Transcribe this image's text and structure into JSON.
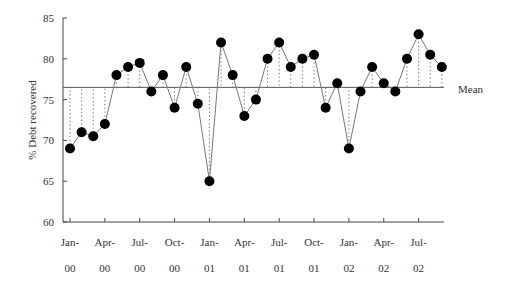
{
  "chart_data": {
    "type": "line",
    "title": "",
    "xlabel": "",
    "ylabel": "% Debt recovered",
    "ylim": [
      60,
      85
    ],
    "yticks": [
      60,
      65,
      70,
      75,
      80,
      85
    ],
    "grid": false,
    "legend": null,
    "x": [
      "Jan-00",
      "Feb-00",
      "Mar-00",
      "Apr-00",
      "May-00",
      "Jun-00",
      "Jul-00",
      "Aug-00",
      "Sep-00",
      "Oct-00",
      "Nov-00",
      "Dec-00",
      "Jan-01",
      "Feb-01",
      "Mar-01",
      "Apr-01",
      "May-01",
      "Jun-01",
      "Jul-01",
      "Aug-01",
      "Sep-01",
      "Oct-01",
      "Nov-01",
      "Dec-01",
      "Jan-02",
      "Feb-02",
      "Mar-02",
      "Apr-02",
      "May-02",
      "Jun-02",
      "Jul-02",
      "Aug-02",
      "Sep-02"
    ],
    "xtick_labels": [
      {
        "month": "Jan-",
        "year": "00",
        "index": 0
      },
      {
        "month": "Apr-",
        "year": "00",
        "index": 3
      },
      {
        "month": "Jul-",
        "year": "00",
        "index": 6
      },
      {
        "month": "Oct-",
        "year": "00",
        "index": 9
      },
      {
        "month": "Jan-",
        "year": "01",
        "index": 12
      },
      {
        "month": "Apr-",
        "year": "01",
        "index": 15
      },
      {
        "month": "Jul-",
        "year": "01",
        "index": 18
      },
      {
        "month": "Oct-",
        "year": "01",
        "index": 21
      },
      {
        "month": "Jan-",
        "year": "02",
        "index": 24
      },
      {
        "month": "Apr-",
        "year": "02",
        "index": 27
      },
      {
        "month": "Jul-",
        "year": "02",
        "index": 30
      }
    ],
    "series": [
      {
        "name": "% Debt recovered",
        "values": [
          69,
          71,
          70.5,
          72,
          78,
          79,
          79.5,
          76,
          78,
          74,
          79,
          74.5,
          65,
          82,
          78,
          73,
          75,
          80,
          82,
          79,
          80,
          80.5,
          74,
          77,
          69,
          76,
          79,
          77,
          76,
          80,
          83,
          80.5,
          79
        ],
        "marker": "circle",
        "color": "#000000"
      }
    ],
    "reference_lines": [
      {
        "name": "Mean",
        "value": 76.5,
        "label": "Mean"
      }
    ],
    "annotations": [
      "Dotted vertical drop lines connect each point to the mean line"
    ]
  }
}
